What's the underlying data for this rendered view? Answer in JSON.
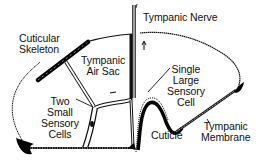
{
  "diagram": {
    "colors": {
      "background": "#ffffff",
      "ink": "#111111",
      "fill_dark": "#000000"
    },
    "labels": {
      "tympanic_nerve": "Tympanic Nerve",
      "cuticular_skeleton": {
        "line1": "Cuticular",
        "line2": "Skeleton"
      },
      "tympanic_air_sac": {
        "line1": "Tympanic",
        "line2": "Air Sac"
      },
      "single_large_sensory_cell": {
        "line1": "Single",
        "line2": "Large",
        "line3": "Sensory",
        "line4": "Cell"
      },
      "two_small_sensory_cells": {
        "line1": "Two",
        "line2": "Small",
        "line3": "Sensory",
        "line4": "Cells"
      },
      "cuticle": "Cuticle",
      "tympanic_membrane": {
        "line1": "Tympanic",
        "line2": "Membrane"
      }
    }
  }
}
